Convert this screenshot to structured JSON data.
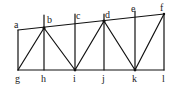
{
  "diagram": {
    "type": "truss",
    "labels": {
      "a": "a",
      "b": "b",
      "c": "c",
      "d": "d",
      "e": "e",
      "f": "f",
      "g": "g",
      "h": "h",
      "i": "i",
      "j": "j",
      "k": "k",
      "l": "l"
    },
    "top_labels": [
      "a",
      "b",
      "c",
      "d",
      "e",
      "f"
    ],
    "bottom_labels": [
      "g",
      "h",
      "i",
      "j",
      "k",
      "l"
    ],
    "colors": {
      "line": "#111111",
      "background": "#ffffff"
    }
  }
}
